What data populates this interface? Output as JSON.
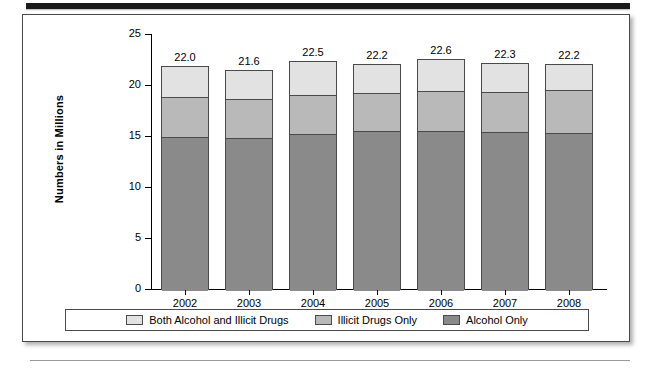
{
  "figure": {
    "y_axis_title": "Numbers in Millions",
    "y_ticks": [
      "25",
      "20",
      "15",
      "10",
      "5",
      "0"
    ]
  },
  "legend": {
    "items": [
      {
        "label": "Both Alcohol and Illicit Drugs",
        "color": "#e2e2e2"
      },
      {
        "label": "Illicit Drugs Only",
        "color": "#b9b9b9"
      },
      {
        "label": "Alcohol Only",
        "color": "#8a8a8a"
      }
    ]
  },
  "chart_data": {
    "type": "bar",
    "stacked": true,
    "title": "",
    "xlabel": "",
    "ylabel": "Numbers in Millions",
    "ylim": [
      0,
      25
    ],
    "ytick_step": 5,
    "grid": false,
    "legend_position": "bottom",
    "categories": [
      "2002",
      "2003",
      "2004",
      "2005",
      "2006",
      "2007",
      "2008"
    ],
    "series": [
      {
        "name": "Alcohol Only",
        "color": "#8a8a8a",
        "values": [
          15.0,
          14.9,
          15.3,
          15.6,
          15.6,
          15.5,
          15.4
        ]
      },
      {
        "name": "Illicit Drugs Only",
        "color": "#b9b9b9",
        "values": [
          3.9,
          3.8,
          3.8,
          3.7,
          3.9,
          3.9,
          4.2
        ]
      },
      {
        "name": "Both Alcohol and Illicit Drugs",
        "color": "#e2e2e2",
        "values": [
          3.2,
          2.9,
          3.4,
          2.9,
          3.1,
          2.9,
          2.6
        ]
      }
    ],
    "totals": [
      "22.0",
      "21.6",
      "22.5",
      "22.2",
      "22.6",
      "22.3",
      "22.2"
    ],
    "total_values": [
      22.0,
      21.6,
      22.5,
      22.2,
      22.6,
      22.3,
      22.2
    ]
  }
}
